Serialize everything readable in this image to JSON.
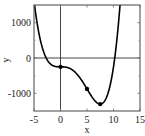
{
  "chart_data": {
    "type": "line",
    "title": "",
    "xlabel": "x",
    "ylabel": "y",
    "xlim": [
      -5,
      15
    ],
    "ylim": [
      -1500,
      1500
    ],
    "xticks": [
      -5,
      0,
      5,
      10,
      15
    ],
    "xtick_labels": [
      "-5",
      "0",
      "5",
      "10",
      "15"
    ],
    "yticks": [
      -1000,
      0,
      1000
    ],
    "ytick_labels": [
      "-1000",
      "0",
      "1000"
    ],
    "grid": false,
    "legend": null,
    "reference_lines": {
      "x": 0,
      "y": 0
    },
    "series": [
      {
        "name": "curve",
        "function": "y = x^4 - 10x^3 - 250",
        "x": [
          -5,
          -4.5,
          -4,
          -3.5,
          -3,
          -2.5,
          -2,
          -1.5,
          -1,
          -0.5,
          0,
          0.5,
          1,
          1.5,
          2,
          2.5,
          3,
          3.5,
          4,
          4.5,
          5,
          5.5,
          6,
          6.5,
          7,
          7.5,
          8,
          8.5,
          9,
          9.5,
          10,
          10.5,
          11,
          11.5
        ],
        "y": [
          1625,
          1071,
          634,
          329,
          110,
          -17,
          -74,
          -211,
          -239,
          -249,
          -250,
          -251,
          -259,
          -279,
          -314,
          -367,
          -439,
          -529,
          -634,
          -750,
          -875,
          -1000,
          -1114,
          -1210,
          -1279,
          -1305,
          -1274,
          -1179,
          -1009,
          -753,
          -250,
          255,
          1081,
          2115
        ]
      }
    ],
    "markers": [
      {
        "x": 0,
        "y": -250
      },
      {
        "x": 5,
        "y": -875
      },
      {
        "x": 7.5,
        "y": -1305
      }
    ]
  }
}
